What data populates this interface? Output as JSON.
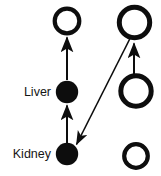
{
  "diagram": {
    "type": "node-link-graph",
    "canvas": {
      "width": 161,
      "height": 176,
      "background": "#ffffff"
    },
    "colors": {
      "filled_node": "#0d0d0d",
      "open_node_stroke": "#0d0d0d",
      "open_node_fill": "#ffffff",
      "edge": "#0d0d0d",
      "label_text": "#151515"
    },
    "labels": {
      "liver": "Liver",
      "kidney": "Kidney"
    },
    "nodes": [
      {
        "id": "node-top-left",
        "name": "open-circle-top-left",
        "style": "open",
        "cx": 67,
        "cy": 21,
        "r": 12.5,
        "stroke_width": 4,
        "label": ""
      },
      {
        "id": "node-top-right",
        "name": "open-circle-top-right",
        "style": "open",
        "cx": 134.5,
        "cy": 22.5,
        "r": 15.5,
        "stroke_width": 5,
        "label": ""
      },
      {
        "id": "node-liver",
        "name": "filled-circle-liver",
        "style": "filled",
        "cx": 67,
        "cy": 92,
        "r": 11,
        "stroke_width": 0,
        "label": "Liver"
      },
      {
        "id": "node-mid-right",
        "name": "open-circle-middle-right",
        "style": "open",
        "cx": 136,
        "cy": 91,
        "r": 15.5,
        "stroke_width": 5,
        "label": ""
      },
      {
        "id": "node-kidney",
        "name": "filled-circle-kidney",
        "style": "filled",
        "cx": 67,
        "cy": 154,
        "r": 11,
        "stroke_width": 0,
        "label": "Kidney"
      },
      {
        "id": "node-bottom-right",
        "name": "open-circle-bottom-right",
        "style": "open",
        "cx": 136,
        "cy": 156,
        "r": 12,
        "stroke_width": 4,
        "label": ""
      }
    ],
    "edges": [
      {
        "id": "edge-liver-to-top-left",
        "name": "arrow-liver-to-top-left",
        "from": "node-liver",
        "to": "node-top-left",
        "x1": 67,
        "y1": 80,
        "x2": 67,
        "y2": 36,
        "stroke_width": 2,
        "arrowhead": "end",
        "direction": "up"
      },
      {
        "id": "edge-kidney-to-liver",
        "name": "arrow-kidney-to-liver",
        "from": "node-kidney",
        "to": "node-liver",
        "x1": 67,
        "y1": 143,
        "x2": 67,
        "y2": 104,
        "stroke_width": 2,
        "arrowhead": "end",
        "direction": "up"
      },
      {
        "id": "edge-top-right-to-kidney",
        "name": "arrow-top-right-to-kidney",
        "from": "node-top-right",
        "to": "node-kidney",
        "x1": 130,
        "y1": 38,
        "x2": 76,
        "y2": 145,
        "stroke_width": 1.6,
        "arrowhead": "end",
        "direction": "down-left"
      },
      {
        "id": "edge-mid-right-to-top-right",
        "name": "arrow-mid-right-to-top-right",
        "from": "node-mid-right",
        "to": "node-top-right",
        "x1": 134,
        "y1": 75,
        "x2": 134,
        "y2": 42,
        "stroke_width": 2,
        "arrowhead": "end",
        "direction": "up"
      }
    ],
    "label_positions": {
      "liver": {
        "x": 50,
        "y": 92
      },
      "kidney": {
        "x": 50,
        "y": 154
      }
    }
  }
}
